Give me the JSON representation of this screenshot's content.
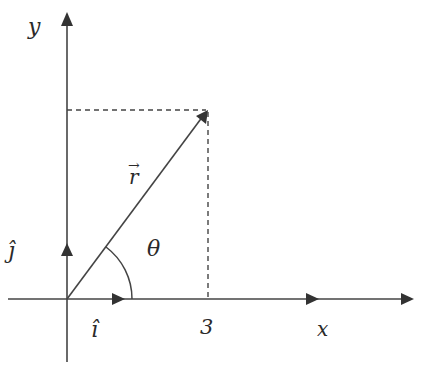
{
  "diagram": {
    "type": "vector-decomposition",
    "labels": {
      "y_axis": "y",
      "x_axis": "x",
      "vector": "r⃗",
      "vector_base": "r",
      "vector_arrow": "→",
      "angle": "θ",
      "unit_i": "î",
      "unit_j": "ĵ",
      "x_tick": "3"
    },
    "colors": {
      "line": "#333333",
      "text": "#2a2a2a",
      "background": "#ffffff"
    }
  }
}
